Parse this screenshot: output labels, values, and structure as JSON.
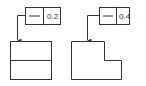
{
  "diagram": {
    "type": "gdt-flatness-examples",
    "line_color": "#333333",
    "examples": [
      {
        "id": "left",
        "feature_control_frame": {
          "symbol": "flatness",
          "symbol_glyph": "—",
          "tolerance": "0.2"
        },
        "part_shape": "rectangle-with-horizontal-divider"
      },
      {
        "id": "right",
        "feature_control_frame": {
          "symbol": "flatness",
          "symbol_glyph": "—",
          "tolerance": "0.4"
        },
        "part_shape": "stepped-l-profile"
      }
    ]
  }
}
